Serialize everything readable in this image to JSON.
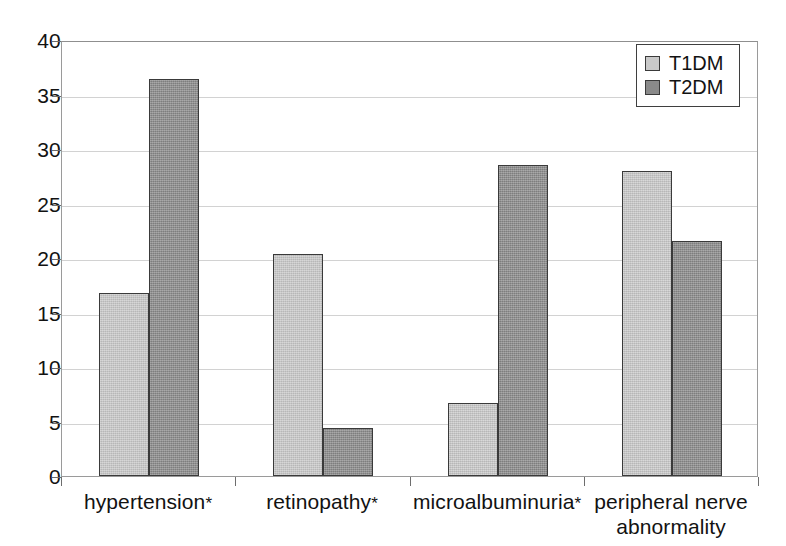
{
  "chart_data": {
    "type": "bar",
    "title": "",
    "subtitle": "",
    "xlabel": "",
    "ylabel": "",
    "ylim": [
      0,
      40
    ],
    "y_ticks": [
      "0",
      "5",
      "10",
      "15",
      "20",
      "25",
      "30",
      "35",
      "40"
    ],
    "grid": true,
    "legend_position": "top-right",
    "categories": [
      "hypertension*",
      "retinopathy*",
      "microalbuminuria*",
      "peripheral nerve abnormality"
    ],
    "category_lines": [
      [
        "hypertension*"
      ],
      [
        "retinopathy*"
      ],
      [
        "microalbuminuria*"
      ],
      [
        "peripheral nerve",
        "abnormality"
      ]
    ],
    "series": [
      {
        "name": "T1DM",
        "color": "#c9c9c9",
        "values": [
          16.8,
          20.4,
          6.7,
          28.0
        ]
      },
      {
        "name": "T2DM",
        "color": "#8a8a8a",
        "values": [
          36.4,
          4.4,
          28.5,
          21.6
        ]
      }
    ]
  },
  "legend": {
    "entries": [
      {
        "label": "T1DM",
        "swatch": "light-gray-swatch"
      },
      {
        "label": "T2DM",
        "swatch": "dark-gray-swatch"
      }
    ]
  },
  "colors": {
    "series_t1dm": "#c9c9c9",
    "series_t2dm": "#8a8a8a",
    "axis": "#6d6d6d",
    "gridline": "#d2d2d2",
    "frame": "#9a9a9a",
    "text": "#121212",
    "background": "#ffffff"
  }
}
